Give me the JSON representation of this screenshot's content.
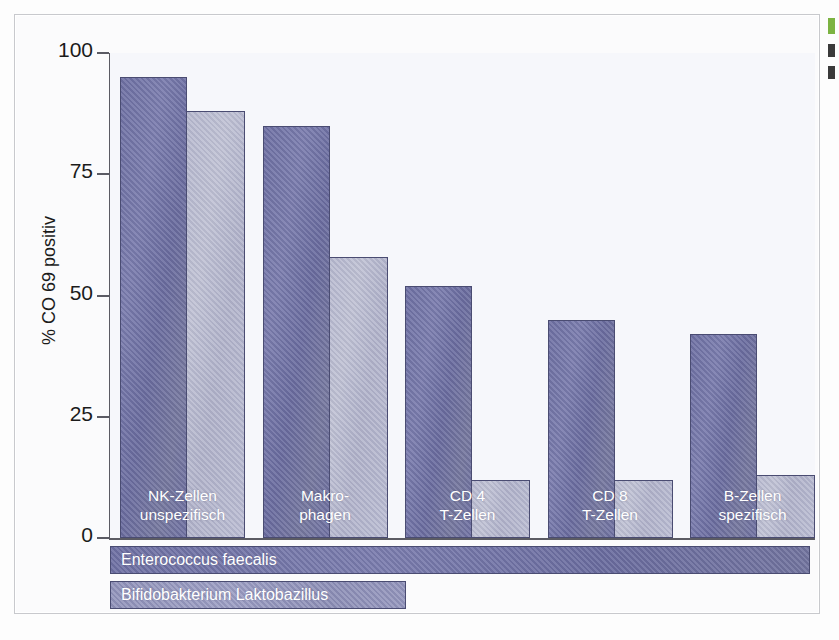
{
  "chart_data": {
    "type": "bar",
    "title": "",
    "subtitle": "",
    "xlabel": "",
    "ylabel": "% CO 69 positiv",
    "ylim": [
      0,
      100
    ],
    "yticks": [
      0,
      25,
      50,
      75,
      100
    ],
    "ytick_labels": [
      "0",
      "25",
      "50",
      "75",
      "100"
    ],
    "grid": false,
    "legend_position": "bottom-left",
    "categories": [
      "NK-Zellen unspezifisch",
      "Makro- phagen",
      "CD 4 T-Zellen",
      "CD 8 T-Zellen",
      "B-Zellen spezifisch"
    ],
    "category_lines": [
      [
        "NK-Zellen",
        "unspezifisch"
      ],
      [
        "Makro-",
        "phagen"
      ],
      [
        "CD 4",
        "T-Zellen"
      ],
      [
        "CD 8",
        "T-Zellen"
      ],
      [
        "B-Zellen",
        "spezifisch"
      ]
    ],
    "series": [
      {
        "name": "Enterococcus faecalis",
        "color": "#6f71a2",
        "values": [
          95,
          85,
          52,
          45,
          42
        ]
      },
      {
        "name": "Bifidobakterium Laktobazillus",
        "color": "#b4b6cd",
        "values": [
          88,
          58,
          12,
          12,
          13
        ]
      }
    ]
  },
  "axis": {
    "y_title": "% CO 69 positiv",
    "ticks": [
      {
        "label": "100",
        "value": 100
      },
      {
        "label": "75",
        "value": 75
      },
      {
        "label": "50",
        "value": 50
      },
      {
        "label": "25",
        "value": 25
      },
      {
        "label": "0",
        "value": 0
      }
    ]
  },
  "legend": {
    "items": [
      {
        "label": "Enterococcus faecalis"
      },
      {
        "label": "Bifidobakterium Laktobazillus"
      }
    ]
  },
  "colors": {
    "series_a": "#6f71a2",
    "series_b": "#b4b6cd",
    "bar_outline": "#4a4c72",
    "axis": "#5b5b63",
    "plot_background": "#f6f7fb",
    "page_background": "#fbfbfc",
    "label_text": "#ffffff",
    "tick_text": "#1b1b1b",
    "artifact_green": "#7cb342"
  }
}
